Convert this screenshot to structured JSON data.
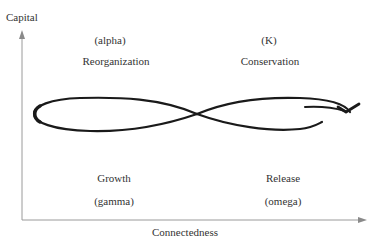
{
  "axes": {
    "y_label": "Capital",
    "x_label": "Connectedness"
  },
  "phases": {
    "reorganization": {
      "symbol": "(alpha)",
      "name": "Reorganization"
    },
    "conservation": {
      "symbol": "(K)",
      "name": "Conservation"
    },
    "growth": {
      "name": "Growth",
      "symbol": "(gamma)"
    },
    "release": {
      "name": "Release",
      "symbol": "(omega)"
    }
  },
  "colors": {
    "axis": "#9a9a9a",
    "loop": "#1a1a1a",
    "text": "#333333"
  }
}
